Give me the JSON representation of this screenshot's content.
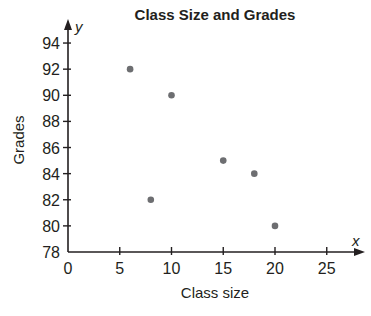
{
  "chart_data": {
    "type": "scatter",
    "title": "Class Size and Grades",
    "xlabel": "Class size",
    "ylabel": "Grades",
    "x_axis_var": "x",
    "y_axis_var": "y",
    "xlim": [
      0,
      27
    ],
    "ylim": [
      78,
      95
    ],
    "x_ticks": [
      0,
      5,
      10,
      15,
      20,
      25
    ],
    "y_ticks": [
      78,
      80,
      82,
      84,
      86,
      88,
      90,
      92,
      94
    ],
    "grid": false,
    "legend": null,
    "points": [
      {
        "x": 6,
        "y": 92
      },
      {
        "x": 8,
        "y": 82
      },
      {
        "x": 10,
        "y": 90
      },
      {
        "x": 15,
        "y": 85
      },
      {
        "x": 18,
        "y": 84
      },
      {
        "x": 20,
        "y": 80
      }
    ],
    "colors": {
      "axis": "#231f20",
      "point": "#6d6e71"
    }
  }
}
